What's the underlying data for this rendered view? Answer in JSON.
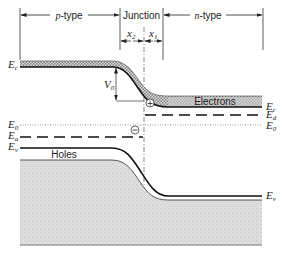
{
  "diagram": {
    "regions": {
      "p_type": "p-type",
      "junction": "Junction",
      "n_type": "n-type"
    },
    "widths": {
      "x2": "x",
      "x2_sub": "2",
      "x1": "x",
      "x1_sub": "1"
    },
    "potential": {
      "label": "V",
      "sub": "0"
    },
    "levels_left": {
      "Ec": {
        "main": "E",
        "sub": "c"
      },
      "E0": {
        "main": "E",
        "sub": "0"
      },
      "Ea": {
        "main": "E",
        "sub": "a"
      },
      "Ev": {
        "main": "E",
        "sub": "v"
      }
    },
    "levels_right": {
      "Ec": {
        "main": "E",
        "sub": "c"
      },
      "Ed": {
        "main": "E",
        "sub": "d"
      },
      "E0": {
        "main": "E",
        "sub": "0"
      },
      "Ev": {
        "main": "E",
        "sub": "v"
      }
    },
    "carriers": {
      "electrons": "Electrons",
      "holes": "Holes"
    },
    "charges": {
      "positive": "+",
      "negative": "−"
    },
    "colors": {
      "line": "#1a1a1a",
      "band_fill": "#cfcfcf",
      "valence_fill": "#dcdcdc",
      "dotted": "#666666"
    }
  }
}
